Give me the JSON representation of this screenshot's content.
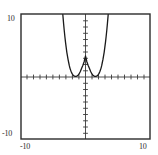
{
  "figure": {
    "title": "",
    "frame": {
      "left": 21,
      "top": 14,
      "right": 150,
      "bottom": 139
    },
    "origin": {
      "x": 85.5,
      "y": 77
    },
    "labels": {
      "y_top": "10",
      "y_bottom": "-10",
      "x_left": "-10",
      "x_right": "10"
    }
  },
  "chart_data": {
    "type": "line",
    "title": "",
    "xlabel": "",
    "ylabel": "",
    "xlim": [
      -10,
      10
    ],
    "ylim": [
      -10,
      10
    ],
    "xticks": [
      -10,
      10
    ],
    "yticks": [
      -10,
      10
    ],
    "tick_interval": 1,
    "grid": false,
    "legend": null,
    "axes": {
      "x_axis_visible": true,
      "y_axis_visible": true,
      "tick_marks": true,
      "frame_box": true
    },
    "series": [
      {
        "name": "quartic",
        "equation": "y = (x^2 - 5.3)^2 / 8.5",
        "color": "#1a1a1a",
        "linewidth": 1.3,
        "double_roots": [
          -2.3,
          2.3
        ],
        "local_maximum": {
          "x": 0,
          "y": 3.3
        },
        "local_minima": [
          {
            "x": -2.3,
            "y": 0
          },
          {
            "x": 2.3,
            "y": 0
          }
        ],
        "exits_top_at": [
          -3.55,
          3.55
        ],
        "x": [
          -3.62,
          -3.5,
          -3.4,
          -3.3,
          -3.2,
          -3.1,
          -3.0,
          -2.9,
          -2.8,
          -2.7,
          -2.6,
          -2.5,
          -2.4,
          -2.3,
          -2.2,
          -2.1,
          -2.0,
          -1.9,
          -1.8,
          -1.7,
          -1.6,
          -1.5,
          -1.4,
          -1.2,
          -1.0,
          -0.8,
          -0.6,
          -0.4,
          -0.2,
          0.0,
          0.2,
          0.4,
          0.6,
          0.8,
          1.0,
          1.2,
          1.4,
          1.5,
          1.6,
          1.7,
          1.8,
          1.9,
          2.0,
          2.1,
          2.2,
          2.3,
          2.4,
          2.5,
          2.6,
          2.7,
          2.8,
          2.9,
          3.0,
          3.1,
          3.2,
          3.3,
          3.4,
          3.5,
          3.62
        ],
        "y": [
          11.2,
          9.7,
          8.5,
          7.4,
          6.4,
          5.5,
          4.7,
          3.9,
          3.3,
          2.7,
          2.2,
          1.7,
          1.3,
          1.0,
          0.72,
          0.5,
          0.33,
          0.2,
          0.11,
          0.05,
          0.02,
          0.01,
          0.03,
          0.15,
          0.4,
          0.8,
          1.3,
          1.8,
          2.4,
          3.3,
          2.4,
          1.8,
          1.3,
          0.8,
          0.4,
          0.15,
          0.03,
          0.01,
          0.02,
          0.05,
          0.11,
          0.2,
          0.33,
          0.5,
          0.72,
          1.0,
          1.3,
          1.7,
          2.2,
          2.7,
          3.3,
          3.9,
          4.7,
          5.5,
          6.4,
          7.4,
          8.5,
          9.7,
          11.2
        ]
      }
    ]
  },
  "colors": {
    "curve": "#1a1a1a",
    "axis": "#3a3a3a",
    "frame": "#2b2b2b",
    "background": "#ffffff",
    "label": "#2b2b2b"
  }
}
